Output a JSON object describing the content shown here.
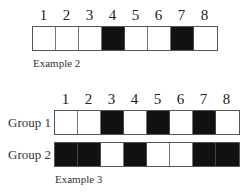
{
  "example2": {
    "numbers": [
      "1",
      "2",
      "3",
      "4",
      "5",
      "6",
      "7",
      "8"
    ],
    "cells": [
      0,
      0,
      0,
      1,
      0,
      0,
      1,
      0
    ],
    "caption": "Example 2"
  },
  "example3": {
    "numbers": [
      "1",
      "2",
      "3",
      "4",
      "5",
      "6",
      "7",
      "8"
    ],
    "groups": [
      {
        "label": "Group 1",
        "cells": [
          0,
          0,
          1,
          0,
          1,
          0,
          1,
          0
        ]
      },
      {
        "label": "Group 2",
        "cells": [
          1,
          1,
          0,
          1,
          0,
          0,
          1,
          1
        ]
      }
    ],
    "caption": "Example 3"
  },
  "colors": {
    "filled": "#111111",
    "empty": "#ffffff"
  }
}
